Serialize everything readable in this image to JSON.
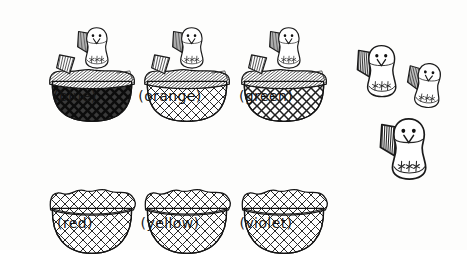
{
  "illustration": {
    "title": "Baskets with chicks",
    "background_color": "#fdfdfc",
    "ink_color": "#1a1a1a",
    "canvas": {
      "width": 467,
      "height": 250
    }
  },
  "baskets": [
    {
      "id": "basket-blue",
      "label": "(blue)",
      "color_name": "blue",
      "state": "open",
      "has_chick": true,
      "weave": "dark-plaid",
      "weave_tone": "dark",
      "x": 30,
      "y": 18,
      "w": 90,
      "h": 70,
      "label_x": 30,
      "label_y": 88,
      "label_w": 90
    },
    {
      "id": "basket-orange",
      "label": "(orange)",
      "color_name": "orange",
      "state": "open",
      "has_chick": true,
      "weave": "light-crosshatch",
      "weave_tone": "light",
      "x": 125,
      "y": 18,
      "w": 90,
      "h": 70,
      "label_x": 122,
      "label_y": 88,
      "label_w": 96
    },
    {
      "id": "basket-green",
      "label": "(green)",
      "color_name": "green",
      "state": "open",
      "has_chick": true,
      "weave": "medium-crosshatch",
      "weave_tone": "medium",
      "x": 222,
      "y": 18,
      "w": 90,
      "h": 70,
      "label_x": 220,
      "label_y": 88,
      "label_w": 92
    },
    {
      "id": "basket-red",
      "label": "(red)",
      "color_name": "red",
      "state": "closed",
      "has_chick": false,
      "weave": "light-crosshatch",
      "weave_tone": "light",
      "x": 30,
      "y": 152,
      "w": 90,
      "h": 68,
      "label_x": 30,
      "label_y": 215,
      "label_w": 90
    },
    {
      "id": "basket-yellow",
      "label": "(yellow)",
      "color_name": "yellow",
      "state": "closed",
      "has_chick": false,
      "weave": "light-crosshatch",
      "weave_tone": "light",
      "x": 125,
      "y": 152,
      "w": 90,
      "h": 68,
      "label_x": 122,
      "label_y": 215,
      "label_w": 96
    },
    {
      "id": "basket-violet",
      "label": "(violet)",
      "color_name": "violet",
      "state": "closed",
      "has_chick": false,
      "weave": "light-crosshatch",
      "weave_tone": "light",
      "x": 222,
      "y": 152,
      "w": 90,
      "h": 68,
      "label_x": 220,
      "label_y": 215,
      "label_w": 92
    }
  ],
  "loose_chicks": [
    {
      "id": "loose-chick-1",
      "x": 355,
      "y": 36,
      "scale": 1.0,
      "rotate": 0
    },
    {
      "id": "loose-chick-2",
      "x": 405,
      "y": 55,
      "scale": 0.86,
      "rotate": 6
    },
    {
      "id": "loose-chick-3",
      "x": 378,
      "y": 108,
      "scale": 1.18,
      "rotate": 0
    }
  ],
  "counts": {
    "baskets_total": 6,
    "baskets_with_chicks": 3,
    "baskets_empty": 3,
    "loose_chicks": 3
  }
}
